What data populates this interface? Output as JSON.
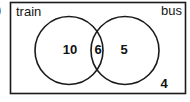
{
  "question_marker": ")",
  "diagram": {
    "type": "venn2",
    "universe_shape": "rectangle",
    "stroke_color": "#1a1a1a",
    "fill_color": "#ffffff",
    "sets": [
      {
        "id": "train",
        "label": "train",
        "label_position": "top-left"
      },
      {
        "id": "bus",
        "label": "bus",
        "label_position": "top-right"
      }
    ],
    "regions": [
      {
        "id": "train-only",
        "label": "train only",
        "value": "10"
      },
      {
        "id": "intersection",
        "label": "train and bus",
        "value": "6"
      },
      {
        "id": "bus-only",
        "label": "bus only",
        "value": "5"
      },
      {
        "id": "outside",
        "label": "neither train nor bus",
        "value": "4"
      }
    ]
  }
}
